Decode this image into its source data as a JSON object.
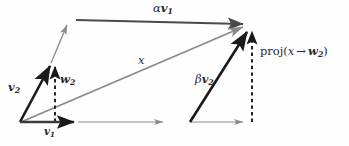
{
  "figure": {
    "width": 349,
    "height": 146,
    "background": "#fefefe",
    "colors": {
      "dark_vector": "#1a1a1a",
      "mid_vector": "#4a4a4a",
      "light_vector": "#8a8a8a",
      "dashed": "#1a1a1a",
      "text": "#2a2a2a"
    }
  },
  "labels": {
    "alpha_v1": {
      "greek": "α",
      "vector": "v",
      "subscript": "1",
      "x": 161,
      "y": 4
    },
    "x": {
      "text": "x",
      "x": 139,
      "y": 58
    },
    "v2": {
      "vector": "v",
      "subscript": "2",
      "x": 9,
      "y": 84
    },
    "w2": {
      "vector": "w",
      "subscript": "2",
      "x": 60,
      "y": 76
    },
    "v1": {
      "vector": "v",
      "subscript": "1",
      "x": 45,
      "y": 127
    },
    "beta_v2": {
      "greek": "β",
      "vector": "v",
      "subscript": "2",
      "x": 196,
      "y": 76
    },
    "projection": {
      "prefix": "proj(",
      "arg": "x",
      "arrow": "→",
      "vector": "w",
      "subscript": "2",
      "suffix": ")",
      "x": 261,
      "y": 48
    }
  },
  "geometry": {
    "origin": {
      "x": 20,
      "y": 122
    },
    "v2_tip": {
      "x": 52,
      "y": 62
    },
    "w2_tip": {
      "x": 55,
      "y": 62
    },
    "top_right": {
      "x": 247,
      "y": 24
    },
    "proj_tip": {
      "x": 252,
      "y": 28
    },
    "beta_base": {
      "x": 190,
      "y": 122
    },
    "baseline_y": 122
  },
  "elements": [
    {
      "name": "alpha-v1-arrow",
      "kind": "arrow",
      "style": "mid",
      "from": [
        76,
        20
      ],
      "to": [
        247,
        24
      ]
    },
    {
      "name": "x-diagonal-arrow",
      "kind": "arrow",
      "style": "light",
      "from": [
        20,
        122
      ],
      "to": [
        247,
        25
      ]
    },
    {
      "name": "v2-arrow",
      "kind": "arrow",
      "style": "dark",
      "from": [
        20,
        122
      ],
      "to": [
        52,
        62
      ]
    },
    {
      "name": "w2-dashed-arrow",
      "kind": "dashed-arrow",
      "style": "dashed",
      "from": [
        55,
        122
      ],
      "to": [
        55,
        62
      ]
    },
    {
      "name": "v1-arrow",
      "kind": "arrow",
      "style": "dark",
      "from": [
        20,
        122
      ],
      "to": [
        78,
        122
      ]
    },
    {
      "name": "v1-extension-arrow",
      "kind": "arrow",
      "style": "light",
      "from": [
        78,
        122
      ],
      "to": [
        167,
        122
      ]
    },
    {
      "name": "parallelogram-left-side-arrow",
      "kind": "arrow",
      "style": "light",
      "from": [
        52,
        62
      ],
      "to": [
        69,
        23
      ]
    },
    {
      "name": "beta-v2-arrow",
      "kind": "arrow",
      "style": "dark",
      "from": [
        190,
        122
      ],
      "to": [
        249,
        28
      ]
    },
    {
      "name": "projection-dashed-arrow",
      "kind": "dashed-arrow",
      "style": "dashed",
      "from": [
        252,
        122
      ],
      "to": [
        252,
        27
      ]
    },
    {
      "name": "baseline-right-arrow",
      "kind": "arrow",
      "style": "light",
      "from": [
        190,
        122
      ],
      "to": [
        247,
        122
      ]
    }
  ]
}
